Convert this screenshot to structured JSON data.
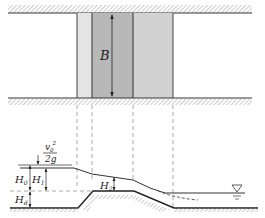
{
  "diagram": {
    "type": "broad-crested weir schematic (plan view and longitudinal section)",
    "plan_view": {
      "width_label": "B",
      "zones": [
        {
          "name": "approach-transition",
          "fill": "#e6e6e6"
        },
        {
          "name": "crest-section",
          "fill": "#b9b9b9"
        },
        {
          "name": "downstream-slope",
          "fill": "#d4d4d4"
        }
      ]
    },
    "section_view": {
      "labels": {
        "velocity_head_numerator": "v",
        "velocity_head_subscript": "0",
        "velocity_head_superscript": "2",
        "velocity_head_denominator": "2g",
        "H0": "H",
        "H0_sub": "0",
        "H1": "H",
        "H1_sub": "1",
        "H2": "H",
        "H2_sub": "2",
        "Hd": "H",
        "Hd_sub": "d"
      },
      "water_level_symbol": "▽"
    },
    "colors": {
      "line": "#333333",
      "hatch": "#888888",
      "dashed": "#666666"
    }
  }
}
